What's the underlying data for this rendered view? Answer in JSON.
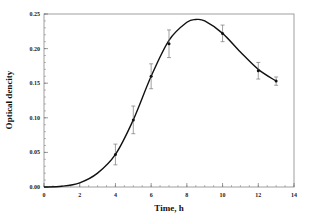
{
  "chart_data": {
    "type": "line",
    "title": "",
    "xlabel": "Time, h",
    "ylabel": "Optical dencity",
    "xlim": [
      0,
      14
    ],
    "ylim": [
      0,
      0.25
    ],
    "x_ticks": [
      "0",
      "2",
      "4",
      "6",
      "8",
      "10",
      "12",
      "14"
    ],
    "y_ticks": [
      "0.00",
      "0.05",
      "0.10",
      "0.15",
      "0.20",
      "0.25"
    ],
    "grid": false,
    "legend": null,
    "series": [
      {
        "name": "measured",
        "type": "scatter_errorbar",
        "x": [
          4,
          5,
          6,
          7,
          10,
          12,
          13
        ],
        "values": [
          0.047,
          0.097,
          0.16,
          0.207,
          0.222,
          0.168,
          0.153
        ],
        "errors": [
          0.015,
          0.02,
          0.018,
          0.02,
          0.012,
          0.012,
          0.006
        ]
      },
      {
        "name": "fit",
        "type": "line",
        "x": [
          0,
          1,
          2,
          3,
          4,
          5,
          6,
          7,
          8,
          8.5,
          9,
          10,
          11,
          12,
          13
        ],
        "values": [
          0.0,
          0.001,
          0.006,
          0.02,
          0.047,
          0.097,
          0.16,
          0.212,
          0.238,
          0.242,
          0.24,
          0.222,
          0.195,
          0.17,
          0.153
        ]
      }
    ]
  }
}
